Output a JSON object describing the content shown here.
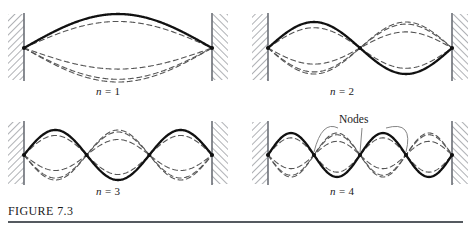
{
  "figure": {
    "caption": "FIGURE 7.3",
    "caption_rule": true,
    "background_color": "#ffffff",
    "solid_curve_color": "#111111",
    "dashed_curve_color": "#555555",
    "wall_color": "#6b6f76",
    "leader_line_color": "#777777"
  },
  "annotations": {
    "nodes_label": "Nodes"
  },
  "panels": [
    {
      "id": "n1",
      "label_n": "n",
      "label_eq": "= 1",
      "harmonic": 1,
      "loops": 1,
      "interior_nodes": 0
    },
    {
      "id": "n2",
      "label_n": "n",
      "label_eq": "= 2",
      "harmonic": 2,
      "loops": 2,
      "interior_nodes": 1
    },
    {
      "id": "n3",
      "label_n": "n",
      "label_eq": "= 3",
      "harmonic": 3,
      "loops": 3,
      "interior_nodes": 2
    },
    {
      "id": "n4",
      "label_n": "n",
      "label_eq": "= 4",
      "harmonic": 4,
      "loops": 4,
      "interior_nodes": 3
    }
  ],
  "chart_data": {
    "type": "line",
    "title": "FIGURE 7.3",
    "xlabel": "",
    "ylabel": "",
    "series": [
      {
        "name": "n = 1",
        "harmonic": 1,
        "amplitude_phases": [
          1.0,
          0.78,
          -0.62,
          -0.92
        ],
        "node_positions_fraction": [
          0.0,
          1.0
        ]
      },
      {
        "name": "n = 2",
        "harmonic": 2,
        "amplitude_phases": [
          1.0,
          0.78,
          -0.62,
          -0.92
        ],
        "node_positions_fraction": [
          0.0,
          0.5,
          1.0
        ]
      },
      {
        "name": "n = 3",
        "harmonic": 3,
        "amplitude_phases": [
          1.0,
          0.78,
          -0.62,
          -0.92
        ],
        "node_positions_fraction": [
          0.0,
          0.3333,
          0.6667,
          1.0
        ]
      },
      {
        "name": "n = 4",
        "harmonic": 4,
        "amplitude_phases": [
          1.0,
          0.78,
          -0.62,
          -0.92
        ],
        "node_positions_fraction": [
          0.0,
          0.25,
          0.5,
          0.75,
          1.0
        ]
      }
    ],
    "legend_position": "none",
    "grid": false
  }
}
